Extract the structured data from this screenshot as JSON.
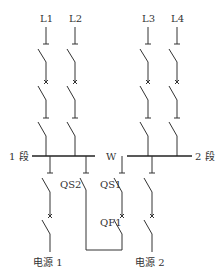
{
  "diagram": {
    "type": "single-line electrical wiring diagram",
    "feeders": [
      {
        "label": "L1",
        "x": 46
      },
      {
        "label": "L2",
        "x": 75
      },
      {
        "label": "L3",
        "x": 148
      },
      {
        "label": "L4",
        "x": 177
      }
    ],
    "bus": {
      "section1_label": "1 段",
      "section2_label": "2 段",
      "coupler_label": "W"
    },
    "switches": {
      "qs1": "QS1",
      "qs2": "QS2",
      "qf1": "QF1"
    },
    "sources": {
      "source1": "电源 1",
      "source2": "电源 2"
    },
    "colors": {
      "line": "#333333",
      "background": "#ffffff"
    }
  }
}
